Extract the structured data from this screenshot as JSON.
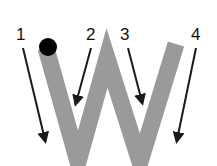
{
  "letter": "W",
  "colors": {
    "letter": "#9a9a9a",
    "arrow": "#1a1a1a",
    "start_dot": "#000000"
  },
  "steps": [
    {
      "label": "1"
    },
    {
      "label": "2"
    },
    {
      "label": "3"
    },
    {
      "label": "4"
    }
  ]
}
